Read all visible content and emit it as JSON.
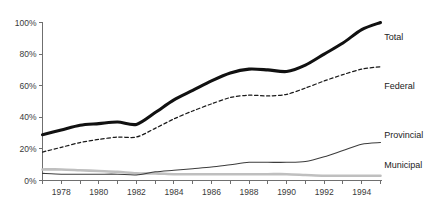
{
  "chart_data": {
    "type": "line",
    "title": "",
    "subtitle": "",
    "xlabel": "",
    "ylabel": "",
    "xlim": [
      1977,
      1995
    ],
    "ylim": [
      0,
      100
    ],
    "grid": false,
    "legend_position": "right-inline-end-of-line",
    "x": [
      1977,
      1978,
      1979,
      1980,
      1981,
      1982,
      1983,
      1984,
      1985,
      1986,
      1987,
      1988,
      1989,
      1990,
      1991,
      1992,
      1993,
      1994,
      1995
    ],
    "y_ticks": [
      0,
      20,
      40,
      60,
      80,
      100
    ],
    "y_tick_labels": [
      "0%",
      "20%",
      "40%",
      "60%",
      "80%",
      "100%"
    ],
    "x_ticks": [
      1977,
      1978,
      1979,
      1980,
      1981,
      1982,
      1983,
      1984,
      1985,
      1986,
      1987,
      1988,
      1989,
      1990,
      1991,
      1992,
      1993,
      1994,
      1995
    ],
    "x_tick_labels": [
      "",
      "1978",
      "",
      "1980",
      "",
      "1982",
      "",
      "1984",
      "",
      "1986",
      "",
      "1988",
      "",
      "1990",
      "",
      "1992",
      "",
      "1994",
      ""
    ],
    "series": [
      {
        "name": "Total",
        "style": "solid-thick",
        "color": "#111111",
        "values": [
          29,
          32,
          35,
          36,
          37,
          35.5,
          43,
          51,
          57,
          63,
          68,
          70.5,
          70,
          69,
          73,
          80,
          87,
          95.5,
          100
        ]
      },
      {
        "name": "Federal",
        "style": "dashed",
        "color": "#1a1a1a",
        "values": [
          18,
          21,
          24,
          26,
          27.5,
          27.5,
          33,
          39,
          44,
          48.5,
          52.5,
          54,
          53.5,
          54.5,
          58.5,
          63,
          67,
          70.5,
          72
        ]
      },
      {
        "name": "Provincial",
        "style": "solid-thin",
        "color": "#3c3c3c",
        "values": [
          4.5,
          4,
          4,
          4,
          4,
          3.5,
          5.5,
          6.5,
          7.5,
          8.5,
          10,
          11.5,
          11.5,
          11.5,
          12,
          15,
          19,
          23,
          24
        ]
      },
      {
        "name": "Municipal",
        "style": "solid-gray",
        "color": "#bfbfbf",
        "values": [
          7,
          7,
          6.5,
          6,
          5.5,
          4.5,
          4.5,
          4,
          4,
          4,
          4,
          4,
          4,
          4,
          3.5,
          3,
          3,
          3,
          3
        ]
      }
    ],
    "series_labels": [
      {
        "text": "Total",
        "x": 1995.2,
        "y": 91
      },
      {
        "text": "Federal",
        "x": 1995.2,
        "y": 60
      },
      {
        "text": "Provincial",
        "x": 1995.2,
        "y": 29
      },
      {
        "text": "Municipal",
        "x": 1995.2,
        "y": 10
      }
    ]
  }
}
